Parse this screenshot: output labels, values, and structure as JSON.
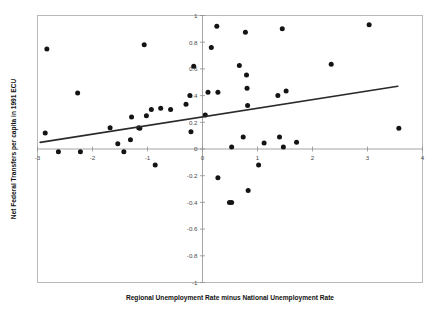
{
  "chart_data": {
    "type": "scatter",
    "title": "",
    "xlabel": "Regional Unemployment Rate minus National Unemployment Rate",
    "ylabel": "Net Federal Transfers per capita in 1991 ECU",
    "xlim": [
      -3.0,
      4.0
    ],
    "ylim": [
      -1.0,
      1.0
    ],
    "xticks": [
      -3,
      -2,
      -1,
      0,
      1,
      2,
      3,
      4
    ],
    "xtick_labels": [
      "-3",
      "-2",
      "-1",
      "0",
      "1",
      "2",
      "3",
      "4"
    ],
    "yticks": [
      -1,
      -0.8,
      -0.6,
      -0.4,
      -0.2,
      0,
      0.2,
      0.4,
      0.6,
      0.8,
      1
    ],
    "ytick_labels": [
      "-1",
      "-0.8",
      "-0.6",
      "-0.4",
      "-0.2",
      "0",
      "0.2",
      "0.4",
      "0.6",
      "0.8",
      "1"
    ],
    "grid": false,
    "legend": false,
    "marker_color": "#141414",
    "trendline_color": "#2a2a2a",
    "frame_color": "#b9b9b9",
    "zero_axis_x": 0,
    "zero_axis_y": 0,
    "trendline": {
      "label": "fitted regression line",
      "x0": -2.95,
      "y0": 0.05,
      "x1": 3.55,
      "y1": 0.47
    },
    "points": [
      {
        "x": -2.83,
        "y": 0.75
      },
      {
        "x": -2.86,
        "y": 0.12
      },
      {
        "x": -2.62,
        "y": -0.02
      },
      {
        "x": -2.27,
        "y": 0.42
      },
      {
        "x": -2.22,
        "y": -0.02
      },
      {
        "x": -1.68,
        "y": 0.16
      },
      {
        "x": -1.54,
        "y": 0.04
      },
      {
        "x": -1.43,
        "y": -0.02
      },
      {
        "x": -1.31,
        "y": 0.07
      },
      {
        "x": -1.29,
        "y": 0.24
      },
      {
        "x": -1.16,
        "y": 0.16
      },
      {
        "x": -1.14,
        "y": 0.155
      },
      {
        "x": -1.06,
        "y": 0.78
      },
      {
        "x": -1.02,
        "y": 0.25
      },
      {
        "x": -0.93,
        "y": 0.295
      },
      {
        "x": -0.86,
        "y": -0.12
      },
      {
        "x": -0.76,
        "y": 0.305
      },
      {
        "x": -0.58,
        "y": 0.295
      },
      {
        "x": -0.3,
        "y": 0.335
      },
      {
        "x": -0.23,
        "y": 0.4
      },
      {
        "x": -0.21,
        "y": 0.13
      },
      {
        "x": -0.16,
        "y": 0.62
      },
      {
        "x": 0.05,
        "y": 0.255
      },
      {
        "x": 0.1,
        "y": 0.425
      },
      {
        "x": 0.16,
        "y": 0.76
      },
      {
        "x": 0.26,
        "y": 0.92
      },
      {
        "x": 0.28,
        "y": 0.425
      },
      {
        "x": 0.28,
        "y": -0.215
      },
      {
        "x": 0.49,
        "y": -0.4
      },
      {
        "x": 0.53,
        "y": -0.4
      },
      {
        "x": 0.53,
        "y": 0.015
      },
      {
        "x": 0.67,
        "y": 0.625
      },
      {
        "x": 0.74,
        "y": 0.09
      },
      {
        "x": 0.78,
        "y": 0.875
      },
      {
        "x": 0.8,
        "y": 0.555
      },
      {
        "x": 0.81,
        "y": 0.455
      },
      {
        "x": 0.82,
        "y": 0.325
      },
      {
        "x": 0.83,
        "y": -0.31
      },
      {
        "x": 1.02,
        "y": -0.12
      },
      {
        "x": 1.12,
        "y": 0.045
      },
      {
        "x": 1.37,
        "y": 0.4
      },
      {
        "x": 1.4,
        "y": 0.09
      },
      {
        "x": 1.45,
        "y": 0.9
      },
      {
        "x": 1.47,
        "y": 0.015
      },
      {
        "x": 1.52,
        "y": 0.435
      },
      {
        "x": 1.71,
        "y": 0.05
      },
      {
        "x": 2.34,
        "y": 0.635
      },
      {
        "x": 3.03,
        "y": 0.93
      },
      {
        "x": 3.57,
        "y": 0.155
      }
    ]
  }
}
